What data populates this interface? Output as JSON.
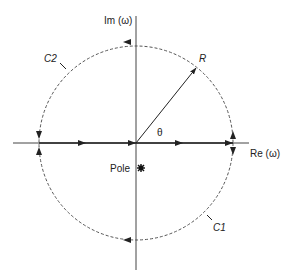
{
  "diagram": {
    "type": "complex-plane contour",
    "axes": {
      "vertical_label": "Im (ω)",
      "horizontal_label": "Re (ω)"
    },
    "labels": {
      "radius": "R",
      "angle": "θ",
      "pole": "Pole",
      "contour_upper": "C2",
      "contour_lower": "C1"
    },
    "colors": {
      "line": "#222222",
      "dashed": "#555555",
      "background": "#ffffff"
    }
  }
}
